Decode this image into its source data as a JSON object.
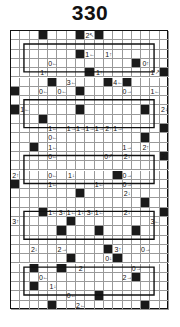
{
  "puzzle": {
    "title": "330",
    "type": "yajilin",
    "grid": {
      "cols": 17,
      "rows": 30
    },
    "black_cells": [
      [
        0,
        3
      ],
      [
        0,
        7
      ],
      [
        0,
        9
      ],
      [
        2,
        7
      ],
      [
        3,
        13
      ],
      [
        4,
        8
      ],
      [
        4,
        16
      ],
      [
        5,
        4
      ],
      [
        5,
        10
      ],
      [
        5,
        12
      ],
      [
        6,
        0
      ],
      [
        6,
        7
      ],
      [
        8,
        0
      ],
      [
        8,
        7
      ],
      [
        8,
        14
      ],
      [
        9,
        3
      ],
      [
        10,
        16
      ],
      [
        12,
        2
      ],
      [
        11,
        14
      ],
      [
        13,
        16
      ],
      [
        14,
        18
      ],
      [
        15,
        11
      ],
      [
        16,
        0
      ],
      [
        17,
        7
      ],
      [
        18,
        14
      ],
      [
        19,
        3
      ],
      [
        19,
        16
      ],
      [
        20,
        6
      ],
      [
        21,
        5
      ],
      [
        21,
        9
      ],
      [
        21,
        13
      ],
      [
        23,
        10
      ],
      [
        24,
        6
      ],
      [
        24,
        11
      ],
      [
        25,
        2
      ],
      [
        25,
        5
      ],
      [
        26,
        13
      ],
      [
        27,
        2
      ],
      [
        28,
        9
      ],
      [
        29,
        4
      ],
      [
        29,
        14
      ]
    ],
    "clues": [
      {
        "r": 0,
        "c": 8,
        "n": "2",
        "dir": "↖"
      },
      {
        "r": 2,
        "c": 8,
        "n": "1",
        "dir": "←"
      },
      {
        "r": 2,
        "c": 10,
        "n": "1",
        "dir": "↑"
      },
      {
        "r": 3,
        "c": 4,
        "n": "0",
        "dir": "←"
      },
      {
        "r": 3,
        "c": 14,
        "n": "0",
        "dir": "↑"
      },
      {
        "r": 4,
        "c": 3,
        "n": "1",
        "dir": "↑"
      },
      {
        "r": 4,
        "c": 9,
        "n": "1",
        "dir": "↑"
      },
      {
        "r": 4,
        "c": 15,
        "n": "1",
        "dir": "↗"
      },
      {
        "r": 5,
        "c": 6,
        "n": "3",
        "dir": "←"
      },
      {
        "r": 5,
        "c": 11,
        "n": "4",
        "dir": "←"
      },
      {
        "r": 6,
        "c": 3,
        "n": "0",
        "dir": "←"
      },
      {
        "r": 6,
        "c": 5,
        "n": "0",
        "dir": "←"
      },
      {
        "r": 6,
        "c": 12,
        "n": "0",
        "dir": "→"
      },
      {
        "r": 6,
        "c": 15,
        "n": "1",
        "dir": "←"
      },
      {
        "r": 8,
        "c": 1,
        "n": "1",
        "dir": "←"
      },
      {
        "r": 8,
        "c": 16,
        "n": "2",
        "dir": "↓"
      },
      {
        "r": 10,
        "c": 4,
        "n": "1",
        "dir": "←"
      },
      {
        "r": 10,
        "c": 6,
        "n": "1",
        "dir": "→"
      },
      {
        "r": 10,
        "c": 7,
        "n": "1",
        "dir": "→"
      },
      {
        "r": 10,
        "c": 8,
        "n": "1",
        "dir": "→"
      },
      {
        "r": 10,
        "c": 9,
        "n": "1",
        "dir": "→"
      },
      {
        "r": 10,
        "c": 10,
        "n": "2",
        "dir": "↑"
      },
      {
        "r": 10,
        "c": 11,
        "n": "1",
        "dir": "→"
      },
      {
        "r": 11,
        "c": 4,
        "n": "0",
        "dir": "←"
      },
      {
        "r": 12,
        "c": 4,
        "n": "1",
        "dir": "←"
      },
      {
        "r": 12,
        "c": 14,
        "n": "2",
        "dir": "↑"
      },
      {
        "r": 12,
        "c": 12,
        "n": "1",
        "dir": "→"
      },
      {
        "r": 13,
        "c": 4,
        "n": "0",
        "dir": "←"
      },
      {
        "r": 13,
        "c": 10,
        "n": "0",
        "dir": "↗"
      },
      {
        "r": 13,
        "c": 12,
        "n": "2",
        "dir": "↓"
      },
      {
        "r": 13,
        "c": 16,
        "n": "2",
        "dir": "↓"
      },
      {
        "r": 15,
        "c": 0,
        "n": "2",
        "dir": "↑"
      },
      {
        "r": 15,
        "c": 4,
        "n": "0",
        "dir": "←"
      },
      {
        "r": 15,
        "c": 6,
        "n": "1",
        "dir": "↓"
      },
      {
        "r": 15,
        "c": 12,
        "n": "0",
        "dir": "→"
      },
      {
        "r": 16,
        "c": 4,
        "n": "1",
        "dir": "←"
      },
      {
        "r": 16,
        "c": 9,
        "n": "1",
        "dir": "←"
      },
      {
        "r": 16,
        "c": 12,
        "n": "0",
        "dir": "→"
      },
      {
        "r": 17,
        "c": 12,
        "n": "2",
        "dir": "↓"
      },
      {
        "r": 19,
        "c": 4,
        "n": "1",
        "dir": "←"
      },
      {
        "r": 19,
        "c": 5,
        "n": "3",
        "dir": "↓"
      },
      {
        "r": 19,
        "c": 6,
        "n": "1",
        "dir": "←"
      },
      {
        "r": 19,
        "c": 7,
        "n": "1",
        "dir": "↓"
      },
      {
        "r": 19,
        "c": 8,
        "n": "3",
        "dir": "↓"
      },
      {
        "r": 19,
        "c": 9,
        "n": "1",
        "dir": "←"
      },
      {
        "r": 19,
        "c": 12,
        "n": "2",
        "dir": "↓"
      },
      {
        "r": 20,
        "c": 0,
        "n": "3",
        "dir": "↑"
      },
      {
        "r": 20,
        "c": 15,
        "n": "3",
        "dir": "←"
      },
      {
        "r": 23,
        "c": 2,
        "n": "2",
        "dir": "↓"
      },
      {
        "r": 23,
        "c": 5,
        "n": "2",
        "dir": "→"
      },
      {
        "r": 23,
        "c": 11,
        "n": "3",
        "dir": "↑"
      },
      {
        "r": 23,
        "c": 14,
        "n": "0",
        "dir": "→"
      },
      {
        "r": 24,
        "c": 6,
        "n": "2",
        "dir": "←"
      },
      {
        "r": 24,
        "c": 10,
        "n": "0",
        "dir": "↓"
      },
      {
        "r": 25,
        "c": 7,
        "n": "2",
        "dir": ""
      },
      {
        "r": 25,
        "c": 13,
        "n": "0",
        "dir": "→"
      },
      {
        "r": 26,
        "c": 3,
        "n": "0",
        "dir": "←"
      },
      {
        "r": 26,
        "c": 12,
        "n": "2",
        "dir": "→"
      },
      {
        "r": 27,
        "c": 4,
        "n": "1",
        "dir": "↓"
      },
      {
        "r": 28,
        "c": 6,
        "n": "0",
        "dir": "←"
      },
      {
        "r": 29,
        "c": 7,
        "n": "2",
        "dir": "←"
      }
    ],
    "colors": {
      "ink": "#111111",
      "black_cell": "#1a1a1a",
      "grid_line": "#999999",
      "background": "#ffffff"
    }
  }
}
